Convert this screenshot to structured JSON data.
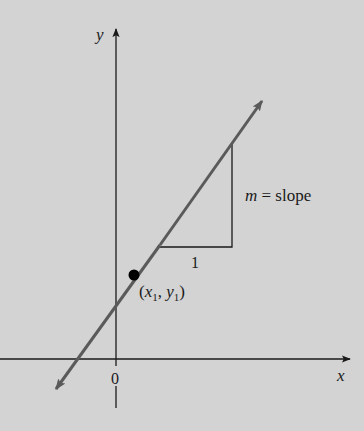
{
  "diagram": {
    "axes": {
      "x_label": "x",
      "y_label": "y",
      "origin_label": "0"
    },
    "point": {
      "label_open": "(",
      "x_var": "x",
      "x_sub": "1",
      "sep": ", ",
      "y_var": "y",
      "y_sub": "1",
      "label_close": ")"
    },
    "slope_triangle": {
      "run_label": "1",
      "rise_label_var": "m",
      "rise_label_rest": " = slope"
    },
    "colors": {
      "background": "#d3d3d3",
      "axis": "#1a1a1a",
      "line": "#5a5a5a",
      "point": "#000000"
    }
  }
}
